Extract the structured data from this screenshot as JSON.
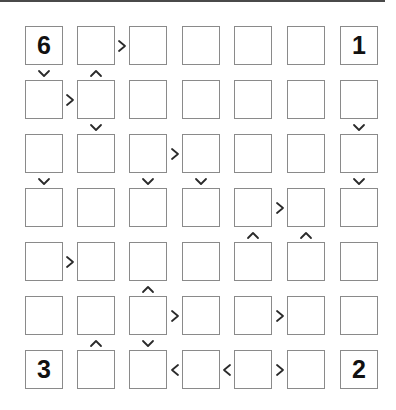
{
  "puzzle": {
    "type": "futoshiki",
    "size": 7,
    "colors": {
      "cell_border": "#8a8a8a",
      "sign": "#2a2a2a",
      "digit": "#111111",
      "top_rule": "#4a4a4a"
    },
    "grid": [
      [
        "6",
        "",
        "",
        "",
        "",
        "",
        "1"
      ],
      [
        "",
        "",
        "",
        "",
        "",
        "",
        ""
      ],
      [
        "",
        "",
        "",
        "",
        "",
        "",
        ""
      ],
      [
        "",
        "",
        "",
        "",
        "",
        "",
        ""
      ],
      [
        "",
        "",
        "",
        "",
        "",
        "",
        ""
      ],
      [
        "",
        "",
        "",
        "",
        "",
        "",
        ""
      ],
      [
        "3",
        "",
        "",
        "",
        "",
        "",
        "2"
      ]
    ],
    "horizontal_signs": [
      {
        "row": 1,
        "left_col": 2,
        "symbol": ">"
      },
      {
        "row": 2,
        "left_col": 1,
        "symbol": ">"
      },
      {
        "row": 3,
        "left_col": 3,
        "symbol": ">"
      },
      {
        "row": 4,
        "left_col": 5,
        "symbol": ">"
      },
      {
        "row": 5,
        "left_col": 1,
        "symbol": ">"
      },
      {
        "row": 6,
        "left_col": 3,
        "symbol": ">"
      },
      {
        "row": 6,
        "left_col": 5,
        "symbol": ">"
      },
      {
        "row": 7,
        "left_col": 3,
        "symbol": "<"
      },
      {
        "row": 7,
        "left_col": 4,
        "symbol": "<"
      },
      {
        "row": 7,
        "left_col": 5,
        "symbol": ">"
      }
    ],
    "vertical_signs": [
      {
        "top_row": 1,
        "col": 1,
        "symbol": "v"
      },
      {
        "top_row": 1,
        "col": 2,
        "symbol": "^"
      },
      {
        "top_row": 2,
        "col": 2,
        "symbol": "v"
      },
      {
        "top_row": 2,
        "col": 7,
        "symbol": "v"
      },
      {
        "top_row": 3,
        "col": 1,
        "symbol": "v"
      },
      {
        "top_row": 3,
        "col": 3,
        "symbol": "v"
      },
      {
        "top_row": 3,
        "col": 4,
        "symbol": "v"
      },
      {
        "top_row": 3,
        "col": 7,
        "symbol": "v"
      },
      {
        "top_row": 4,
        "col": 5,
        "symbol": "^"
      },
      {
        "top_row": 4,
        "col": 6,
        "symbol": "^"
      },
      {
        "top_row": 5,
        "col": 3,
        "symbol": "^"
      },
      {
        "top_row": 6,
        "col": 2,
        "symbol": "^"
      },
      {
        "top_row": 6,
        "col": 3,
        "symbol": "v"
      }
    ]
  }
}
